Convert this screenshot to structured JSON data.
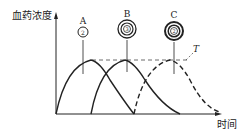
{
  "diagram": {
    "y_axis_label": "血药浓度",
    "x_axis_label": "时间",
    "threshold_label": "T",
    "capsules": [
      {
        "label": "A",
        "inner_text": "2",
        "rings": 1
      },
      {
        "label": "B",
        "inner_text": "3",
        "rings": 3
      },
      {
        "label": "C",
        "inner_text": "2",
        "rings": 3
      }
    ],
    "curves": [
      {
        "name": "A",
        "style": "solid"
      },
      {
        "name": "B",
        "style": "solid"
      },
      {
        "name": "C",
        "style": "dashed"
      }
    ],
    "colors": {
      "ink": "#222222",
      "background": "#ffffff"
    }
  }
}
